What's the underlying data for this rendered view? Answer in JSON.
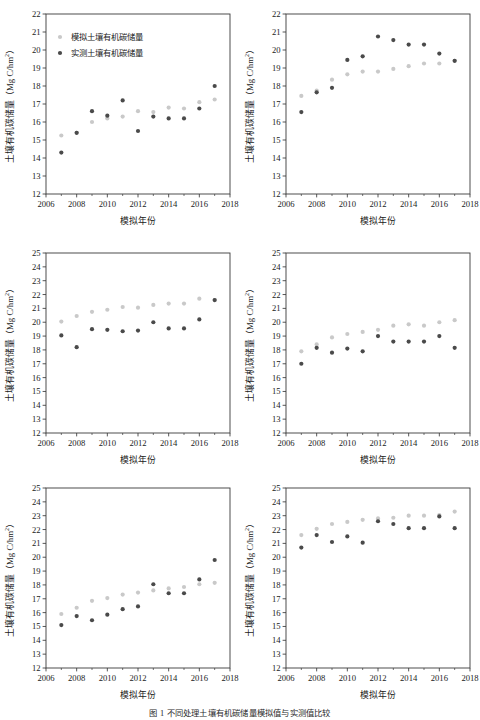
{
  "figure": {
    "caption": "图 1  不同处理土壤有机碳储量模拟值与实测值比较",
    "marker_colors": {
      "simulated": "#c9c9c9",
      "measured": "#4a4a4a"
    },
    "axis_color": "#3a3a3a"
  },
  "legend": {
    "simulated_label": "模拟土壤有机碳储量",
    "measured_label": "实测土壤有机碳储量"
  },
  "axis_labels": {
    "x": "模拟年份",
    "y_prefix": "土壤有机碳储量（Mg C/hm",
    "y_sup": "2",
    "y_suffix": "）"
  },
  "chart_data": [
    {
      "id": "panel-a",
      "type": "scatter",
      "title": "",
      "xlabel": "模拟年份",
      "ylabel": "土壤有机碳储量（Mg C/hm2）",
      "xlim": [
        2006,
        2018
      ],
      "ylim": [
        12,
        22
      ],
      "xticks": [
        2006,
        2008,
        2010,
        2012,
        2014,
        2016,
        2018
      ],
      "yticks": [
        12,
        13,
        14,
        15,
        16,
        17,
        18,
        19,
        20,
        21,
        22
      ],
      "grid": false,
      "legend": "inside-top-left",
      "x": [
        2007,
        2008,
        2009,
        2010,
        2011,
        2012,
        2013,
        2014,
        2015,
        2016,
        2017
      ],
      "series": [
        {
          "name": "模拟土壤有机碳储量",
          "values": [
            15.25,
            15.4,
            16.0,
            16.2,
            16.3,
            16.6,
            16.55,
            16.8,
            16.75,
            17.1,
            17.25
          ]
        },
        {
          "name": "实测土壤有机碳储量",
          "values": [
            14.3,
            15.4,
            16.6,
            16.35,
            17.2,
            15.5,
            16.3,
            16.2,
            16.2,
            16.75,
            18.0
          ]
        }
      ]
    },
    {
      "id": "panel-b",
      "type": "scatter",
      "title": "",
      "xlabel": "模拟年份",
      "ylabel": "土壤有机碳储量（Mg C/hm2）",
      "xlim": [
        2006,
        2018
      ],
      "ylim": [
        12,
        22
      ],
      "xticks": [
        2006,
        2008,
        2010,
        2012,
        2014,
        2016,
        2018
      ],
      "yticks": [
        12,
        13,
        14,
        15,
        16,
        17,
        18,
        19,
        20,
        21,
        22
      ],
      "grid": false,
      "legend": "none",
      "x": [
        2007,
        2008,
        2009,
        2010,
        2011,
        2012,
        2013,
        2014,
        2015,
        2016,
        2017
      ],
      "series": [
        {
          "name": "模拟土壤有机碳储量",
          "values": [
            17.45,
            17.75,
            18.35,
            18.65,
            18.8,
            18.8,
            18.95,
            19.1,
            19.25,
            19.25,
            19.4
          ]
        },
        {
          "name": "实测土壤有机碳储量",
          "values": [
            16.55,
            17.65,
            17.9,
            19.45,
            19.65,
            20.75,
            20.55,
            20.3,
            20.3,
            19.8,
            19.4
          ]
        }
      ]
    },
    {
      "id": "panel-c",
      "type": "scatter",
      "title": "",
      "xlabel": "模拟年份",
      "ylabel": "土壤有机碳储量（Mg C/hm2）",
      "xlim": [
        2006,
        2018
      ],
      "ylim": [
        12,
        25
      ],
      "xticks": [
        2006,
        2008,
        2010,
        2012,
        2014,
        2016,
        2018
      ],
      "yticks": [
        12,
        13,
        14,
        15,
        16,
        17,
        18,
        19,
        20,
        21,
        22,
        23,
        24,
        25
      ],
      "grid": false,
      "legend": "none",
      "x": [
        2007,
        2008,
        2009,
        2010,
        2011,
        2012,
        2013,
        2014,
        2015,
        2016,
        2017
      ],
      "series": [
        {
          "name": "模拟土壤有机碳储量",
          "values": [
            20.05,
            20.45,
            20.75,
            20.9,
            21.1,
            21.05,
            21.25,
            21.35,
            21.35,
            21.7,
            21.6
          ]
        },
        {
          "name": "实测土壤有机碳储量",
          "values": [
            19.05,
            18.2,
            19.5,
            19.45,
            19.35,
            19.4,
            20.0,
            19.55,
            19.55,
            20.2,
            21.6
          ]
        }
      ]
    },
    {
      "id": "panel-d",
      "type": "scatter",
      "title": "",
      "xlabel": "模拟年份",
      "ylabel": "土壤有机碳储量（Mg C/hm2）",
      "xlim": [
        2006,
        2018
      ],
      "ylim": [
        12,
        25
      ],
      "xticks": [
        2006,
        2008,
        2010,
        2012,
        2014,
        2016,
        2018
      ],
      "yticks": [
        12,
        13,
        14,
        15,
        16,
        17,
        18,
        19,
        20,
        21,
        22,
        23,
        24,
        25
      ],
      "grid": false,
      "legend": "none",
      "x": [
        2007,
        2008,
        2009,
        2010,
        2011,
        2012,
        2013,
        2014,
        2015,
        2016,
        2017
      ],
      "series": [
        {
          "name": "模拟土壤有机碳储量",
          "values": [
            17.9,
            18.4,
            18.9,
            19.15,
            19.3,
            19.45,
            19.75,
            19.85,
            19.75,
            20.0,
            20.15
          ]
        },
        {
          "name": "实测土壤有机碳储量",
          "values": [
            17.0,
            18.15,
            17.8,
            18.1,
            17.9,
            19.0,
            18.6,
            18.6,
            18.6,
            19.0,
            18.15
          ]
        }
      ]
    },
    {
      "id": "panel-e",
      "type": "scatter",
      "title": "",
      "xlabel": "模拟年份",
      "ylabel": "土壤有机碳储量（Mg C/hm2）",
      "xlim": [
        2006,
        2018
      ],
      "ylim": [
        12,
        25
      ],
      "xticks": [
        2006,
        2008,
        2010,
        2012,
        2014,
        2016,
        2018
      ],
      "yticks": [
        12,
        13,
        14,
        15,
        16,
        17,
        18,
        19,
        20,
        21,
        22,
        23,
        24,
        25
      ],
      "grid": false,
      "legend": "none",
      "x": [
        2007,
        2008,
        2009,
        2010,
        2011,
        2012,
        2013,
        2014,
        2015,
        2016,
        2017
      ],
      "series": [
        {
          "name": "模拟土壤有机碳储量",
          "values": [
            15.9,
            16.35,
            16.85,
            17.05,
            17.3,
            17.45,
            17.6,
            17.75,
            17.85,
            18.05,
            18.15
          ]
        },
        {
          "name": "实测土壤有机碳储量",
          "values": [
            15.1,
            15.75,
            15.45,
            15.85,
            16.25,
            16.45,
            18.05,
            17.4,
            17.4,
            18.4,
            19.8
          ]
        }
      ]
    },
    {
      "id": "panel-f",
      "type": "scatter",
      "title": "",
      "xlabel": "模拟年份",
      "ylabel": "土壤有机碳储量（Mg C/hm2）",
      "xlim": [
        2006,
        2018
      ],
      "ylim": [
        12,
        25
      ],
      "xticks": [
        2006,
        2008,
        2010,
        2012,
        2014,
        2016,
        2018
      ],
      "yticks": [
        12,
        13,
        14,
        15,
        16,
        17,
        18,
        19,
        20,
        21,
        22,
        23,
        24,
        25
      ],
      "grid": false,
      "legend": "none",
      "x": [
        2007,
        2008,
        2009,
        2010,
        2011,
        2012,
        2013,
        2014,
        2015,
        2016,
        2017
      ],
      "series": [
        {
          "name": "模拟土壤有机碳储量",
          "values": [
            21.6,
            22.05,
            22.4,
            22.55,
            22.7,
            22.8,
            22.85,
            23.0,
            23.0,
            23.05,
            23.3
          ]
        },
        {
          "name": "实测土壤有机碳储量",
          "values": [
            20.7,
            21.6,
            21.1,
            21.5,
            21.05,
            22.6,
            22.4,
            22.1,
            22.1,
            22.95,
            22.1
          ]
        }
      ]
    }
  ]
}
